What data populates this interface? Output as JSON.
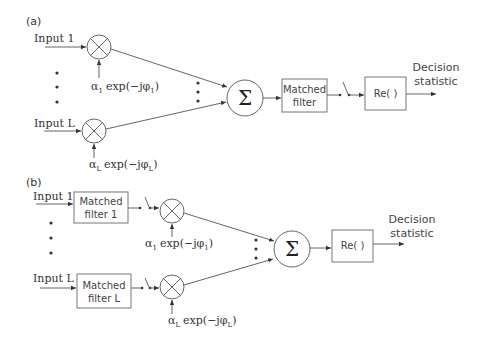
{
  "diagram": {
    "panel_a": {
      "label": "(a)",
      "input_1": "Input 1",
      "input_L": "Input L",
      "weight_1": {
        "alpha": "α",
        "alpha_sub": "1",
        "exp": "exp(−jφ",
        "phi_sub": "1",
        "close": ")"
      },
      "weight_L": {
        "alpha": "α",
        "alpha_sub": "L",
        "exp": "exp(−jφ",
        "phi_sub": "L",
        "close": ")"
      },
      "sum_symbol": "Σ",
      "matched_filter": {
        "line1": "Matched",
        "line2": "filter"
      },
      "real_part": "Re(  )",
      "output": {
        "line1": "Decision",
        "line2": "statistic"
      }
    },
    "panel_b": {
      "label": "(b)",
      "input_1": "Input 1",
      "input_L": "Input L",
      "matched_filter_1": {
        "line1": "Matched",
        "line2": "filter 1"
      },
      "matched_filter_L": {
        "line1": "Matched",
        "line2": "filter L"
      },
      "weight_1": {
        "alpha": "α",
        "alpha_sub": "1",
        "exp": "exp(−jφ",
        "phi_sub": "1",
        "close": ")"
      },
      "weight_L": {
        "alpha": "α",
        "alpha_sub": "L",
        "exp": "exp(−jφ",
        "phi_sub": "L",
        "close": ")"
      },
      "sum_symbol": "Σ",
      "real_part": "Re(  )",
      "output": {
        "line1": "Decision",
        "line2": "statistic"
      }
    },
    "colors": {
      "line": "#555555",
      "text": "#333333",
      "box_border": "#777777"
    }
  }
}
